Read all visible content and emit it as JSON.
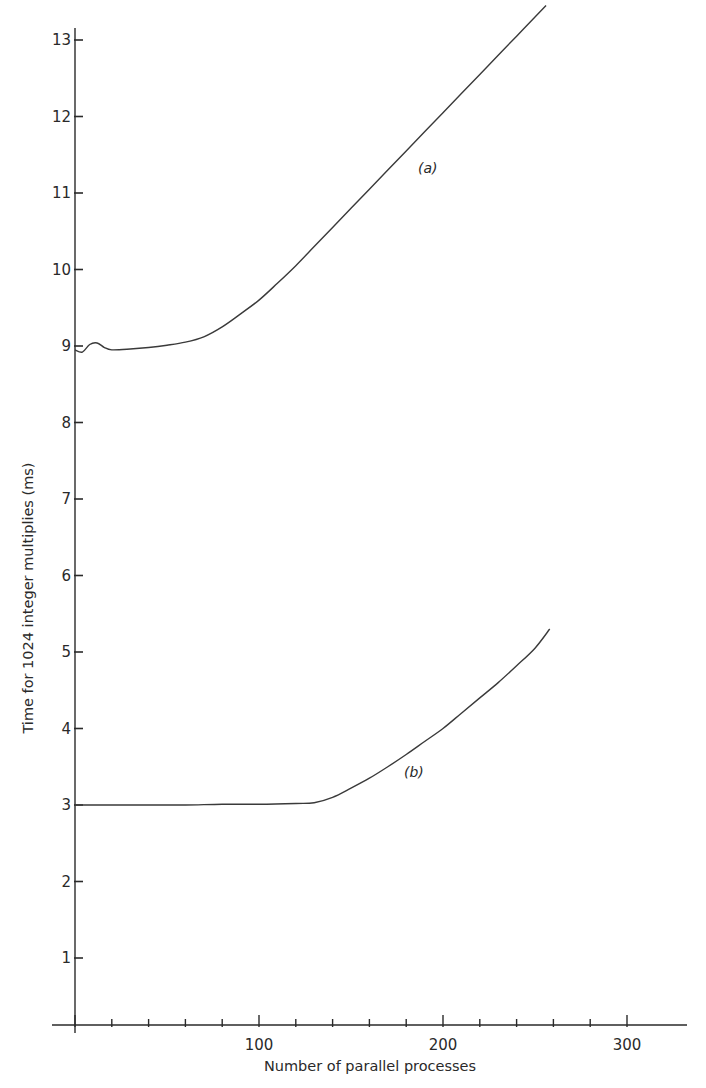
{
  "chart_data": {
    "type": "line",
    "title": "",
    "xlabel": "Number of parallel processes",
    "ylabel": "Time for 1024 integer multiplies (ms)",
    "xlim": [
      0,
      340
    ],
    "ylim": [
      0,
      13.2
    ],
    "x_ticks_major": [
      100,
      200,
      300
    ],
    "x_tick_labels": [
      "100",
      "200",
      "300"
    ],
    "x_ticks_minor_step": 20,
    "y_ticks": [
      1,
      2,
      3,
      4,
      5,
      6,
      7,
      8,
      9,
      10,
      11,
      12,
      13
    ],
    "y_tick_labels": [
      "1",
      "2",
      "3",
      "4",
      "5",
      "6",
      "7",
      "8",
      "9",
      "10",
      "11",
      "12",
      "13"
    ],
    "grid": false,
    "legend": "inline curve labels",
    "series": [
      {
        "name": "(a)",
        "x": [
          0,
          4,
          8,
          12,
          16,
          20,
          30,
          40,
          50,
          60,
          70,
          80,
          90,
          100,
          110,
          120,
          130,
          140,
          150,
          160,
          170,
          180,
          190,
          200,
          210,
          220,
          230,
          240,
          250,
          256
        ],
        "values": [
          8.95,
          8.92,
          9.02,
          9.04,
          8.98,
          8.95,
          8.96,
          8.98,
          9.01,
          9.05,
          9.12,
          9.25,
          9.42,
          9.6,
          9.82,
          10.05,
          10.3,
          10.55,
          10.8,
          11.05,
          11.3,
          11.55,
          11.8,
          12.05,
          12.3,
          12.55,
          12.8,
          13.05,
          13.3,
          13.45
        ]
      },
      {
        "name": "(b)",
        "x": [
          0,
          20,
          40,
          60,
          80,
          100,
          120,
          130,
          140,
          150,
          160,
          170,
          180,
          190,
          200,
          210,
          220,
          230,
          240,
          250,
          258
        ],
        "values": [
          3.0,
          3.0,
          3.0,
          3.0,
          3.01,
          3.01,
          3.02,
          3.03,
          3.1,
          3.22,
          3.35,
          3.5,
          3.66,
          3.83,
          4.0,
          4.2,
          4.4,
          4.6,
          4.82,
          5.05,
          5.3
        ]
      }
    ],
    "annotations": [
      {
        "text": "(a)",
        "x": 195,
        "y": 11.25
      },
      {
        "text": "(b)",
        "x": 187,
        "y": 3.8
      }
    ],
    "colors": {
      "line": "#3a3a3a",
      "axis": "#2a2a2a",
      "background": "#ffffff"
    }
  },
  "labels": {
    "xlabel": "Number of parallel processes",
    "ylabel": "Time for 1024 integer multiplies (ms)",
    "curve_a": "(a)",
    "curve_b": "(b)"
  }
}
